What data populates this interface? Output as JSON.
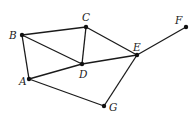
{
  "diagram": {
    "type": "undirected-graph",
    "nodes": [
      {
        "id": "A",
        "label": "A",
        "x": 29,
        "y": 79,
        "lx": 19,
        "ly": 85
      },
      {
        "id": "B",
        "label": "B",
        "x": 22,
        "y": 35,
        "lx": 9,
        "ly": 39
      },
      {
        "id": "C",
        "label": "C",
        "x": 86,
        "y": 27,
        "lx": 82,
        "ly": 21
      },
      {
        "id": "D",
        "label": "D",
        "x": 82,
        "y": 64,
        "lx": 79,
        "ly": 78
      },
      {
        "id": "E",
        "label": "E",
        "x": 137,
        "y": 55,
        "lx": 133,
        "ly": 51
      },
      {
        "id": "F",
        "label": "F",
        "x": 186,
        "y": 27,
        "lx": 175,
        "ly": 24
      },
      {
        "id": "G",
        "label": "G",
        "x": 104,
        "y": 106,
        "lx": 109,
        "ly": 111
      }
    ],
    "edges": [
      [
        "B",
        "C"
      ],
      [
        "B",
        "A"
      ],
      [
        "B",
        "D"
      ],
      [
        "C",
        "D"
      ],
      [
        "C",
        "E"
      ],
      [
        "A",
        "D"
      ],
      [
        "D",
        "E"
      ],
      [
        "E",
        "F"
      ],
      [
        "E",
        "G"
      ],
      [
        "A",
        "G"
      ]
    ]
  }
}
